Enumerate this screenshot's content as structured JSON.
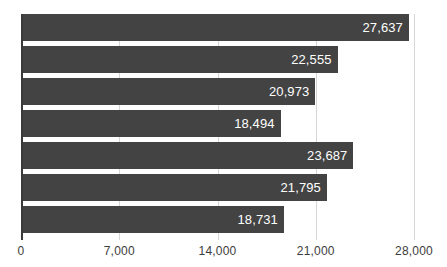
{
  "chart_data": {
    "type": "bar",
    "orientation": "horizontal",
    "title": "",
    "subtitle": "",
    "xlabel": "",
    "ylabel": "",
    "categories": [
      "",
      "",
      "",
      "",
      "",
      "",
      ""
    ],
    "values": [
      27637,
      22555,
      20973,
      18494,
      23687,
      21795,
      18731
    ],
    "data_labels": [
      "27,637",
      "22,555",
      "20,973",
      "18,494",
      "23,687",
      "21,795",
      "18,731"
    ],
    "xlim": [
      0,
      28000
    ],
    "x_ticks": [
      0,
      7000,
      14000,
      21000,
      28000
    ],
    "x_tick_labels": [
      "0",
      "7,000",
      "14,000",
      "21,000",
      "28,000"
    ],
    "grid": "vertical",
    "legend": "none",
    "annotations": [],
    "colors": {
      "bar": "#434343",
      "grid": "#d6d6d6",
      "axis": "#3a3a3a",
      "data_label_text": "#ffffff",
      "tick_label_text": "#3c3c3c",
      "background": "#ffffff"
    }
  }
}
